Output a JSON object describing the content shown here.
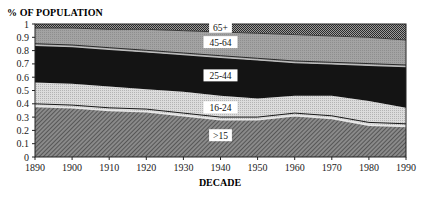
{
  "chart_data": {
    "type": "area",
    "stacked": true,
    "title": "",
    "ylabel": "% OF POPULATION",
    "xlabel": "DECADE",
    "x": [
      1890,
      1900,
      1910,
      1920,
      1930,
      1940,
      1950,
      1960,
      1970,
      1980,
      1990
    ],
    "xlim": [
      1890,
      1990
    ],
    "ylim": [
      0,
      1
    ],
    "yticks": [
      "0",
      "0.1",
      "0.2",
      "0.3",
      "0.4",
      "0.5",
      "0.6",
      "0.7",
      "0.8",
      "0.9",
      "1"
    ],
    "xticks": [
      "1890",
      "1900",
      "1910",
      "1920",
      "1930",
      "1940",
      "1950",
      "1960",
      "1970",
      "1980",
      "1990"
    ],
    "grid": false,
    "legend": "inline band labels",
    "series": [
      {
        "name": ">15",
        "values": [
          0.38,
          0.37,
          0.35,
          0.34,
          0.31,
          0.28,
          0.28,
          0.31,
          0.29,
          0.24,
          0.23
        ]
      },
      {
        "name": "16-24",
        "values": [
          0.18,
          0.18,
          0.18,
          0.17,
          0.18,
          0.18,
          0.16,
          0.15,
          0.17,
          0.18,
          0.14
        ]
      },
      {
        "name": "25-44",
        "values": [
          0.28,
          0.28,
          0.28,
          0.28,
          0.28,
          0.29,
          0.29,
          0.25,
          0.24,
          0.27,
          0.31
        ]
      },
      {
        "name": "45-64",
        "values": [
          0.13,
          0.14,
          0.15,
          0.17,
          0.18,
          0.19,
          0.2,
          0.21,
          0.21,
          0.21,
          0.2
        ]
      },
      {
        "name": "65+",
        "values": [
          0.03,
          0.03,
          0.04,
          0.04,
          0.05,
          0.06,
          0.07,
          0.08,
          0.09,
          0.1,
          0.12
        ]
      }
    ],
    "divider_line": {
      "name": "16-24 lower edge line",
      "offset": 0.02
    },
    "annotations": [
      {
        "text": "65+",
        "x": 1940,
        "y": 0.975
      },
      {
        "text": "45-64",
        "x": 1940,
        "y": 0.86
      },
      {
        "text": "25-44",
        "x": 1940,
        "y": 0.61
      },
      {
        "text": "16-24",
        "x": 1940,
        "y": 0.37
      },
      {
        "text": ">15",
        "x": 1940,
        "y": 0.16
      }
    ]
  },
  "labels": {
    "y_title": "% OF POPULATION",
    "x_title": "DECADE"
  },
  "colors": {
    "band_15": "#6e6e6e",
    "band_16_24": "#d2d2d2",
    "band_25_44": "#151515",
    "band_45_64": "#9a9a9a",
    "band_65": "#555555",
    "line": "#1a1a1a"
  }
}
